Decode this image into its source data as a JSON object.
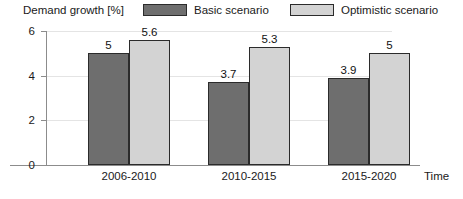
{
  "chart_data": {
    "type": "bar",
    "title": "Demand growth [%]",
    "xlabel": "Time",
    "ylabel": "Demand growth [%]",
    "categories": [
      "2006-2010",
      "2010-2015",
      "2015-2020"
    ],
    "series": [
      {
        "name": "Basic scenario",
        "color": "#6e6e6e",
        "values": [
          5,
          3.7,
          3.9
        ],
        "labels": [
          "5",
          "3.7",
          "3.9"
        ]
      },
      {
        "name": "Optimistic scenario",
        "color": "#d3d3d3",
        "values": [
          5.6,
          5.3,
          5
        ],
        "labels": [
          "5.6",
          "5.3",
          "5"
        ]
      }
    ],
    "ylim": [
      0,
      6
    ],
    "yticks": [
      0,
      2,
      4,
      6
    ],
    "ytick_labels": [
      "0",
      "2",
      "4",
      "6"
    ],
    "grid": true,
    "legend_position": "top"
  },
  "axes": {
    "y_title": "Demand growth [%]",
    "x_title": "Time"
  },
  "legend": {
    "items": [
      {
        "label": "Basic scenario",
        "swatch": "#6e6e6e"
      },
      {
        "label": "Optimistic scenario",
        "swatch": "#d3d3d3"
      }
    ]
  },
  "colors": {
    "basic": "#6e6e6e",
    "optimistic": "#d3d3d3",
    "axis": "#8c8c8c",
    "grid": "#e4e4e4",
    "bar_outline": "#2b2b2b",
    "text": "#1a1a1a"
  }
}
